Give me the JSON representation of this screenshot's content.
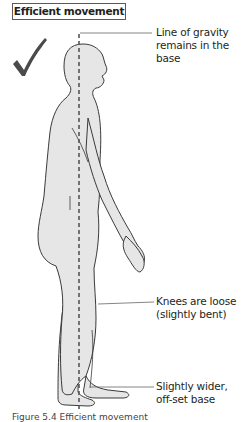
{
  "diagram": {
    "title": "Efficient movement",
    "check_mark": "check-icon",
    "labels": [
      {
        "line1": "Line of gravity",
        "line2": "remains in the base"
      },
      {
        "line1": "Knees are loose",
        "line2": "(slightly bent)"
      },
      {
        "line1": "Slightly wider,",
        "line2": "off-set base"
      }
    ],
    "caption": "Figure 5.4 Efficient movement",
    "colors": {
      "fill": "#e6e6e6",
      "outline": "#3a3a3a",
      "gravity_line": "#555555"
    }
  }
}
